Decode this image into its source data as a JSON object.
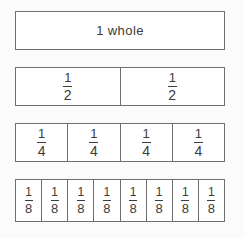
{
  "diagram": {
    "background_color": "#fbfbfb",
    "bar_border_color": "#6e6e6e",
    "cell_fill_color": "#ffffff",
    "text_color": "#3b3b3b"
  },
  "rows": [
    {
      "id": "whole",
      "denominator": 1,
      "cell_count": 1,
      "cells": [
        {
          "label": "1 whole",
          "numerator": "1",
          "denominator": "1"
        }
      ]
    },
    {
      "id": "halves",
      "denominator": 2,
      "cell_count": 2,
      "cells": [
        {
          "numerator": "1",
          "denominator": "2"
        },
        {
          "numerator": "1",
          "denominator": "2"
        }
      ]
    },
    {
      "id": "fourths",
      "denominator": 4,
      "cell_count": 4,
      "cells": [
        {
          "numerator": "1",
          "denominator": "4"
        },
        {
          "numerator": "1",
          "denominator": "4"
        },
        {
          "numerator": "1",
          "denominator": "4"
        },
        {
          "numerator": "1",
          "denominator": "4"
        }
      ]
    },
    {
      "id": "eighths",
      "denominator": 8,
      "cell_count": 8,
      "cells": [
        {
          "numerator": "1",
          "denominator": "8"
        },
        {
          "numerator": "1",
          "denominator": "8"
        },
        {
          "numerator": "1",
          "denominator": "8"
        },
        {
          "numerator": "1",
          "denominator": "8"
        },
        {
          "numerator": "1",
          "denominator": "8"
        },
        {
          "numerator": "1",
          "denominator": "8"
        },
        {
          "numerator": "1",
          "denominator": "8"
        },
        {
          "numerator": "1",
          "denominator": "8"
        }
      ]
    }
  ]
}
